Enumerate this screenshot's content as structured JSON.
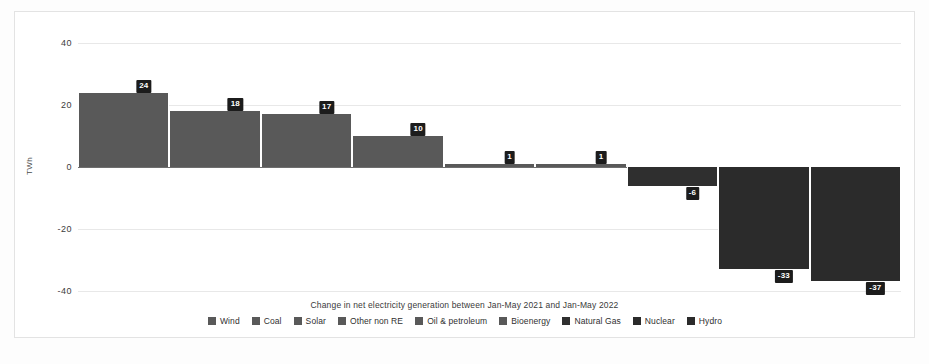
{
  "chart_data": {
    "type": "bar",
    "title": "Change in net electricity generation between Jan-May 2021 and Jan-May 2022",
    "xlabel": "",
    "ylabel": "TWh",
    "ylim": [
      -45,
      45
    ],
    "yticks": [
      40,
      20,
      0,
      -20,
      -40
    ],
    "ytick_labels": [
      "40",
      "20",
      "0",
      "-20",
      "-40"
    ],
    "grid": true,
    "legend_position": "bottom",
    "categories": [
      "Wind",
      "Coal",
      "Solar",
      "Other non RE",
      "Oil & petroleum",
      "Bioenergy",
      "Natural Gas",
      "Nuclear",
      "Hydro"
    ],
    "values": [
      24,
      18,
      17,
      10,
      1,
      1,
      -6,
      -33,
      -37
    ],
    "data_labels": [
      "24",
      "18",
      "17",
      "10",
      "1",
      "1",
      "-6",
      "-33",
      "-37"
    ],
    "colors": [
      "#595959",
      "#595959",
      "#595959",
      "#595959",
      "#595959",
      "#595959",
      "#2f2f2f",
      "#2b2b2b",
      "#2b2b2b"
    ]
  },
  "legend": {
    "items": [
      {
        "label": "Wind",
        "color": "#595959"
      },
      {
        "label": "Coal",
        "color": "#595959"
      },
      {
        "label": "Solar",
        "color": "#595959"
      },
      {
        "label": "Other non RE",
        "color": "#595959"
      },
      {
        "label": "Oil & petroleum",
        "color": "#595959"
      },
      {
        "label": "Bioenergy",
        "color": "#595959"
      },
      {
        "label": "Natural Gas",
        "color": "#2f2f2f"
      },
      {
        "label": "Nuclear",
        "color": "#2b2b2b"
      },
      {
        "label": "Hydro",
        "color": "#2b2b2b"
      }
    ]
  }
}
